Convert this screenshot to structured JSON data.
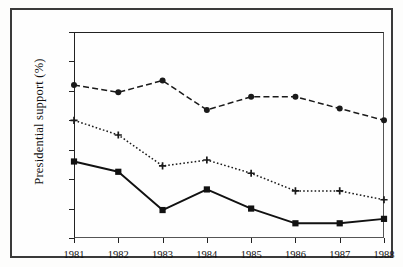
{
  "chart_data": {
    "type": "line",
    "title": "",
    "xlabel": "",
    "ylabel": "Presidential support (%)",
    "categories": [
      "1981",
      "1982",
      "1983",
      "1984",
      "1985",
      "1986",
      "1987",
      "1988"
    ],
    "x": [
      1981,
      1982,
      1983,
      1984,
      1985,
      1986,
      1987,
      1988
    ],
    "ylim": [
      20,
      90
    ],
    "yticks": [
      20,
      30,
      40,
      50,
      60,
      70,
      80,
      90
    ],
    "ytick_labels": [
      "20",
      "30",
      "40",
      "50",
      "60",
      "70",
      "80",
      "90"
    ],
    "grid": false,
    "legend": "none",
    "series": [
      {
        "name": "dashed-circle-series",
        "marker": "filled-circle",
        "linestyle": "dashed",
        "color": "#1a1a1a",
        "values": [
          72,
          69.5,
          73.5,
          63.5,
          68,
          68,
          64,
          60
        ]
      },
      {
        "name": "dotted-plus-series",
        "marker": "plus",
        "linestyle": "dotted",
        "color": "#1a1a1a",
        "values": [
          60,
          55,
          44.5,
          46.5,
          42,
          36,
          36,
          33
        ]
      },
      {
        "name": "solid-square-series",
        "marker": "filled-square",
        "linestyle": "solid",
        "color": "#111111",
        "values": [
          46,
          42.5,
          29.5,
          36.5,
          30,
          25,
          25,
          26.5
        ]
      }
    ]
  },
  "axis": {
    "y_title": "Presidential support (%)"
  }
}
